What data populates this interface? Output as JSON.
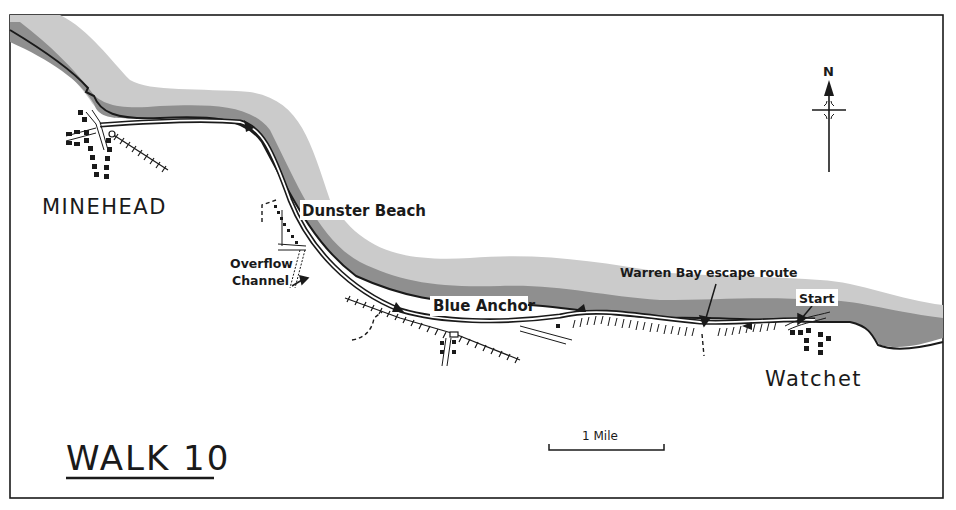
{
  "map": {
    "title": "WALK 10",
    "compass": {
      "label": "N"
    },
    "scale": {
      "label": "1 Mile"
    },
    "places": {
      "minehead": "MINEHEAD",
      "dunster_beach": "Dunster Beach",
      "overflow_line1": "Overflow",
      "overflow_line2": "Channel",
      "blue_anchor": "Blue Anchor",
      "warren_bay": "Warren Bay escape route",
      "start": "Start",
      "watchet": "Watchet"
    },
    "colors": {
      "ink": "#1a1a1a",
      "sea_light": "#c9c9c9",
      "sea_dark": "#8f8f8f",
      "paper": "#ffffff"
    }
  }
}
